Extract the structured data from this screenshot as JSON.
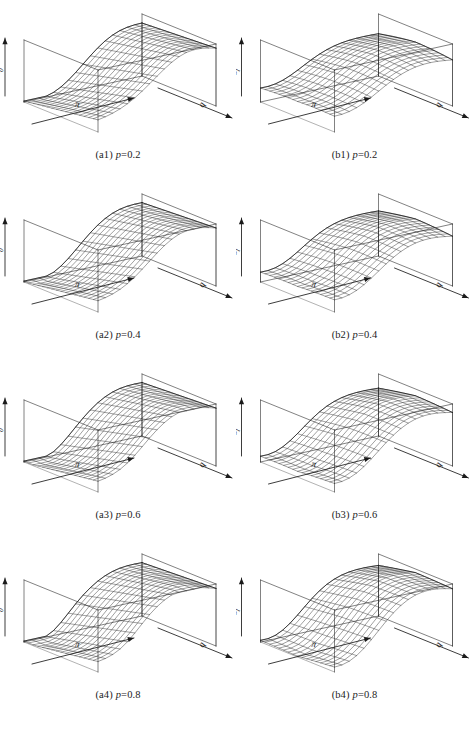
{
  "figure": {
    "type": "multi-panel-3d-surface-figure",
    "layout": {
      "columns": 2,
      "rows": 4
    },
    "ink_color": "#1a1a1a",
    "background_color": "#ffffff"
  },
  "axes": {
    "x_label": "π",
    "y_label": "q",
    "z_label_column_a": "ℰ",
    "z_label_column_a_sub": "0",
    "z_label_column_b": "ℰ",
    "z_label_column_b_sub": "1"
  },
  "panels": [
    {
      "id": "a1",
      "tag": "(a1)",
      "expr_var": "p",
      "expr_rest": "=0.2",
      "caption": "(a1) p=0.2",
      "column": "a",
      "row": 1,
      "p": 0.2,
      "z_label": "ℰ",
      "z_sub": "0",
      "surface_shape": "monotone-ridge"
    },
    {
      "id": "b1",
      "tag": "(b1)",
      "expr_var": "p",
      "expr_rest": "=0.2",
      "caption": "(b1) p=0.2",
      "column": "b",
      "row": 1,
      "p": 0.2,
      "z_label": "ℰ",
      "z_sub": "1",
      "surface_shape": "saddle"
    },
    {
      "id": "a2",
      "tag": "(a2)",
      "expr_var": "p",
      "expr_rest": "=0.4",
      "caption": "(a2) p=0.4",
      "column": "a",
      "row": 2,
      "p": 0.4,
      "z_label": "ℰ",
      "z_sub": "0",
      "surface_shape": "monotone-ridge"
    },
    {
      "id": "b2",
      "tag": "(b2)",
      "expr_var": "p",
      "expr_rest": "=0.4",
      "caption": "(b2) p=0.4",
      "column": "b",
      "row": 2,
      "p": 0.4,
      "z_label": "ℰ",
      "z_sub": "1",
      "surface_shape": "saddle"
    },
    {
      "id": "a3",
      "tag": "(a3)",
      "expr_var": "p",
      "expr_rest": "=0.6",
      "caption": "(a3) p=0.6",
      "column": "a",
      "row": 3,
      "p": 0.6,
      "z_label": "ℰ",
      "z_sub": "0",
      "surface_shape": "monotone-ridge"
    },
    {
      "id": "b3",
      "tag": "(b3)",
      "expr_var": "p",
      "expr_rest": "=0.6",
      "caption": "(b3) p=0.6",
      "column": "b",
      "row": 3,
      "p": 0.6,
      "z_label": "ℰ",
      "z_sub": "1",
      "surface_shape": "saddle"
    },
    {
      "id": "a4",
      "tag": "(a4)",
      "expr_var": "p",
      "expr_rest": "=0.8",
      "caption": "(a4) p=0.8",
      "column": "a",
      "row": 4,
      "p": 0.8,
      "z_label": "ℰ",
      "z_sub": "0",
      "surface_shape": "monotone-ridge"
    },
    {
      "id": "b4",
      "tag": "(b4)",
      "expr_var": "p",
      "expr_rest": "=0.8",
      "caption": "(b4) p=0.8",
      "column": "b",
      "row": 4,
      "p": 0.8,
      "z_label": "ℰ",
      "z_sub": "1",
      "surface_shape": "saddle"
    }
  ],
  "chart_data": {
    "type": "surface",
    "title": "",
    "xlabel": "π",
    "ylabel": "q",
    "zlabel": "ℰ",
    "grid": true,
    "legend": "none",
    "panel_count": 8,
    "parameter_name": "p",
    "parameter_values": [
      0.2,
      0.4,
      0.6,
      0.8
    ],
    "series": [
      {
        "name": "ℰ0 (column a)",
        "panels": [
          "a1",
          "a2",
          "a3",
          "a4"
        ],
        "shape": "monotone ridge increasing in π, plateau at high π, dips toward low q",
        "zlim": [
          0,
          1
        ]
      },
      {
        "name": "ℰ1 (column b)",
        "panels": [
          "b1",
          "b2",
          "b3",
          "b4"
        ],
        "shape": "saddle: rises at one diagonal corner pair, falls at the other",
        "zlim": [
          -1,
          1
        ]
      }
    ],
    "x": [
      0,
      0.1,
      0.2,
      0.3,
      0.4,
      0.5,
      0.6,
      0.7,
      0.8,
      0.9,
      1
    ],
    "y": [
      0,
      0.1,
      0.2,
      0.3,
      0.4,
      0.5,
      0.6,
      0.7,
      0.8,
      0.9,
      1
    ],
    "axis_ticks_shown": false,
    "mesh_lines_u": 16,
    "mesh_lines_v": 16
  }
}
